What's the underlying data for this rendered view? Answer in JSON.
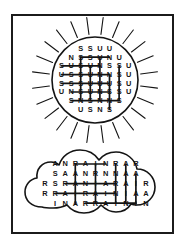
{
  "page": {
    "background_color": "#ffffff",
    "border_color": "#1b1b1b"
  },
  "puzzle": {
    "type": "word-search",
    "theme": "weather",
    "shapes": [
      {
        "name": "sun",
        "label": "sun-shape",
        "letters_used": [
          "S",
          "U",
          "N"
        ],
        "ray_count": 24,
        "grid": [
          [
            "",
            "",
            "S",
            "S",
            "U",
            "U",
            "",
            ""
          ],
          [
            "",
            "N",
            "S",
            "S",
            "U",
            "N",
            "U",
            ""
          ],
          [
            "S",
            "U",
            "S",
            "U",
            "N",
            "S",
            "S",
            "U"
          ],
          [
            "U",
            "S",
            "S",
            "U",
            "N",
            "N",
            "S",
            "U"
          ],
          [
            "S",
            "S",
            "S",
            "U",
            "U",
            "U",
            "S",
            "U"
          ],
          [
            "U",
            "N",
            "S",
            "U",
            "N",
            "S",
            "S",
            "U"
          ],
          [
            "",
            "S",
            "N",
            "S",
            "N",
            "N",
            "S",
            ""
          ],
          [
            "",
            "",
            "U",
            "S",
            "N",
            "S",
            "",
            ""
          ]
        ],
        "found_words": [
          {
            "word": "SUN",
            "direction": "horizontal",
            "row": 1,
            "start_col": 2,
            "end_col": 5
          },
          {
            "word": "SUN",
            "direction": "horizontal",
            "row": 2,
            "start_col": 0,
            "end_col": 4
          },
          {
            "word": "SUN",
            "direction": "horizontal",
            "row": 3,
            "start_col": 0,
            "end_col": 5
          },
          {
            "word": "SUN",
            "direction": "horizontal",
            "row": 4,
            "start_col": 0,
            "end_col": 5
          },
          {
            "word": "SUN",
            "direction": "horizontal",
            "row": 5,
            "start_col": 1,
            "end_col": 5
          },
          {
            "word": "SUN",
            "direction": "horizontal",
            "row": 6,
            "start_col": 1,
            "end_col": 6
          },
          {
            "word": "SUN",
            "direction": "vertical",
            "col": 2,
            "start_row": 1,
            "end_row": 6
          },
          {
            "word": "SUN",
            "direction": "vertical",
            "col": 3,
            "start_row": 2,
            "end_row": 6
          },
          {
            "word": "SUN",
            "direction": "vertical",
            "col": 4,
            "start_row": 1,
            "end_row": 6
          },
          {
            "word": "SUN",
            "direction": "vertical",
            "col": 5,
            "start_row": 3,
            "end_row": 7
          },
          {
            "word": "SUN",
            "direction": "vertical",
            "col": 6,
            "start_row": 2,
            "end_row": 6
          }
        ]
      },
      {
        "name": "cloud",
        "label": "cloud-shape",
        "letters_used": [
          "R",
          "A",
          "I",
          "N"
        ],
        "grid": [
          [
            "",
            "A",
            "N",
            "R",
            "A",
            "I",
            "N",
            "R",
            "A",
            "R",
            ""
          ],
          [
            "",
            "S",
            "A",
            "A",
            "N",
            "R",
            "N",
            "N",
            "A",
            "A",
            ""
          ],
          [
            "R",
            "S",
            "R",
            "A",
            "N",
            "I",
            "A",
            "R",
            "A",
            "I",
            "R"
          ],
          [
            "R",
            "R",
            "A",
            "I",
            "R",
            "A",
            "I",
            "N",
            "I",
            "A",
            "A"
          ],
          [
            "",
            "I",
            "N",
            "A",
            "R",
            "R",
            "A",
            "I",
            "N",
            "I",
            "N"
          ]
        ],
        "found_words": [
          {
            "word": "RAIN",
            "direction": "horizontal",
            "row": 0,
            "start_col": 3,
            "end_col": 6
          },
          {
            "word": "RAIN",
            "direction": "horizontal",
            "row": 2,
            "start_col": 2,
            "end_col": 7
          },
          {
            "word": "RAIN",
            "direction": "horizontal",
            "row": 3,
            "start_col": 1,
            "end_col": 7
          },
          {
            "word": "RAIN",
            "direction": "horizontal",
            "row": 4,
            "start_col": 4,
            "end_col": 9
          },
          {
            "word": "RAIN",
            "direction": "vertical",
            "col": 3,
            "start_row": 0,
            "end_row": 4
          },
          {
            "word": "RAIN",
            "direction": "vertical",
            "col": 5,
            "start_row": 0,
            "end_row": 4
          },
          {
            "word": "RAIN",
            "direction": "vertical",
            "col": 7,
            "start_row": 0,
            "end_row": 4
          },
          {
            "word": "RAIN",
            "direction": "vertical",
            "col": 8,
            "start_row": 0,
            "end_row": 4
          },
          {
            "word": "RAIN",
            "direction": "vertical",
            "col": 9,
            "start_row": 1,
            "end_row": 4
          }
        ]
      }
    ]
  }
}
